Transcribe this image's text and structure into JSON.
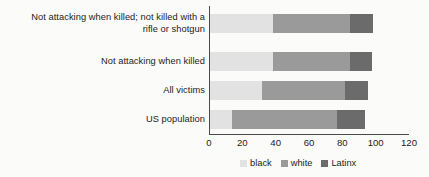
{
  "chart_data": {
    "type": "bar",
    "orientation": "horizontal",
    "stacked": true,
    "title": "",
    "xlabel": "",
    "ylabel": "",
    "xlim": [
      0,
      120
    ],
    "xticks": [
      0,
      20,
      40,
      60,
      80,
      100,
      120
    ],
    "grid": false,
    "legend_position": "bottom",
    "categories": [
      "Not attacking when killed; not killed with a\nrifle or shotgun",
      "Not attacking when killed",
      "All victims",
      "US population"
    ],
    "series": [
      {
        "name": "black",
        "color": "#e2e2e2",
        "values": [
          38,
          38,
          31,
          13
        ]
      },
      {
        "name": "white",
        "color": "#9a9a9a",
        "values": [
          46,
          46,
          50,
          63
        ]
      },
      {
        "name": "Latinx",
        "color": "#6b6b6b",
        "values": [
          14,
          13,
          14,
          17
        ]
      }
    ],
    "totals": [
      98,
      97,
      95,
      93
    ]
  },
  "axis": {
    "tick_labels": [
      "0",
      "20",
      "40",
      "60",
      "80",
      "100",
      "120"
    ]
  },
  "legend": {
    "items": [
      {
        "label": "black"
      },
      {
        "label": "white"
      },
      {
        "label": "Latinx"
      }
    ]
  },
  "colors": {
    "background": "#fbfbf9",
    "axis": "#4a4a4a",
    "text": "#1b1b1b",
    "black_series": "#e2e2e2",
    "white_series": "#9a9a9a",
    "latinx_series": "#6b6b6b"
  }
}
